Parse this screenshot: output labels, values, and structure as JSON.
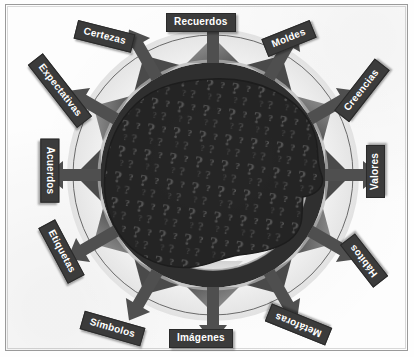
{
  "diagram": {
    "center": {
      "shape_name": "head-silhouette",
      "fill_symbol": "?",
      "description": "Silueta de cabeza humana rellena de signos de interrogación"
    },
    "ring": {
      "name": "gear-ring",
      "segments": 12
    },
    "colors": {
      "label_background": "#3b3b3b",
      "label_text": "#ffffff",
      "ink_dark": "#2b2b2b",
      "ink_mid": "#6f6f6f",
      "ink_light": "#c9c9c9",
      "paper": "#fdfdfd",
      "frame": "#9a9a9a"
    },
    "nodes": [
      {
        "id": "recuerdos",
        "label": "Recuerdos",
        "angle_deg": 90,
        "rotation_deg": 0
      },
      {
        "id": "moldes",
        "label": "Moldes",
        "angle_deg": 60,
        "rotation_deg": -22
      },
      {
        "id": "creencias",
        "label": "Creencias",
        "angle_deg": 30,
        "rotation_deg": -52
      },
      {
        "id": "valores",
        "label": "Valores",
        "angle_deg": 0,
        "rotation_deg": -90
      },
      {
        "id": "habitos",
        "label": "Hábitos",
        "angle_deg": -30,
        "rotation_deg": -128
      },
      {
        "id": "metaforas",
        "label": "Metáforas",
        "angle_deg": -60,
        "rotation_deg": -158
      },
      {
        "id": "imagenes",
        "label": "Imágenes",
        "angle_deg": -90,
        "rotation_deg": 0
      },
      {
        "id": "simbolos",
        "label": "Símbolos",
        "angle_deg": -120,
        "rotation_deg": 16
      },
      {
        "id": "etiquetas",
        "label": "Etiquetas",
        "angle_deg": -150,
        "rotation_deg": 62
      },
      {
        "id": "acuerdos",
        "label": "Acuerdos",
        "angle_deg": 180,
        "rotation_deg": 90
      },
      {
        "id": "expectativas",
        "label": "Expectativas",
        "angle_deg": 150,
        "rotation_deg": 52
      },
      {
        "id": "certezas",
        "label": "Certezas",
        "angle_deg": 120,
        "rotation_deg": 14
      }
    ]
  }
}
